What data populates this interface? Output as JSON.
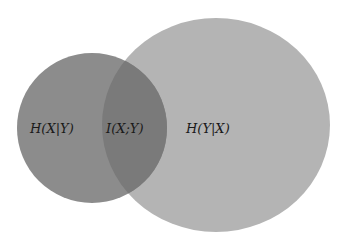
{
  "diagram": {
    "type": "venn",
    "title": "",
    "sets": [
      {
        "name": "H(X)",
        "cx": 92,
        "cy": 128,
        "rx": 75,
        "ry": 75,
        "color": "#8c8c8c"
      },
      {
        "name": "H(Y)",
        "cx": 216,
        "cy": 125,
        "rx": 114,
        "ry": 107,
        "color": "#b4b4b4"
      }
    ],
    "overlap_color": "#7a7a7a",
    "labels": {
      "left_only": "H(X|Y)",
      "intersection": "I(X;Y)",
      "right_only": "H(Y|X)"
    }
  }
}
